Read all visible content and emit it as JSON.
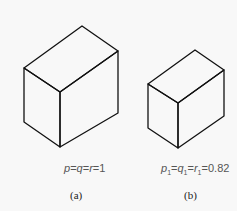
{
  "figure": {
    "panels": [
      {
        "id": "a",
        "caption": "(a)",
        "formula": {
          "p": "p",
          "q": "q",
          "r": "r",
          "eq": "=",
          "value": "1"
        },
        "formula_text": "p=q=r=1",
        "cube": {
          "top": [
            82,
            26
          ],
          "left_top": [
            24,
            68
          ],
          "right_top": [
            118,
            51
          ],
          "front_top": [
            60,
            92
          ],
          "left_bottom": [
            24,
            122
          ],
          "front_bottom": [
            60,
            147
          ],
          "right_bottom": [
            118,
            113
          ]
        }
      },
      {
        "id": "b",
        "caption": "(b)",
        "formula": {
          "p": "p",
          "q": "q",
          "r": "r",
          "sub": "1",
          "eq": "=",
          "value": "0.82"
        },
        "formula_text": "p1=q1=r1=0.82",
        "cube": {
          "top": [
            195,
            50
          ],
          "left_top": [
            148,
            84
          ],
          "right_top": [
            224,
            70
          ],
          "front_top": [
            178,
            103
          ],
          "left_bottom": [
            148,
            128
          ],
          "front_bottom": [
            178,
            148
          ],
          "right_bottom": [
            224,
            116
          ]
        }
      }
    ],
    "line_color": "#111111",
    "background": "#f8f8f8"
  }
}
